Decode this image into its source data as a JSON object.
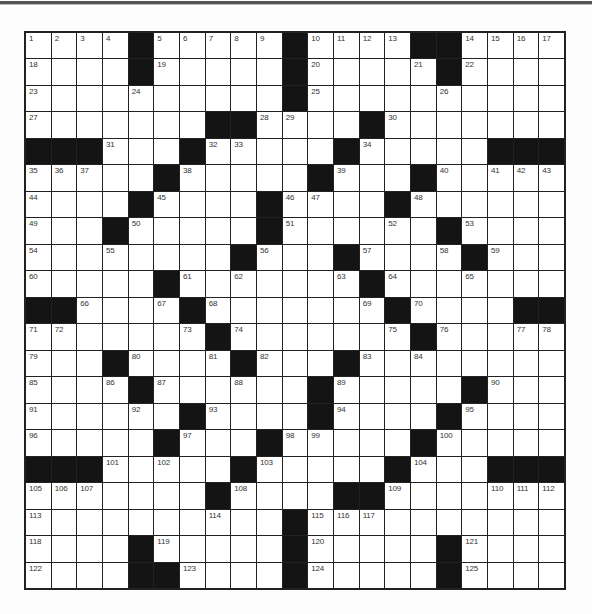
{
  "puzzle": {
    "type": "crossword",
    "rows": 21,
    "cols": 21,
    "colors": {
      "block": "#141414",
      "cell": "#ffffff",
      "gridline": "#222222",
      "number": "#333333"
    },
    "grid": [
      "....#.....#....##....",
      "....#.....#.....#....",
      "..........#..........",
      ".......##....#.......",
      "###...#.....#.....###",
      ".....#.....#...#.....",
      "....#....#....#......",
      "...#.....#......#....",
      "........#...#....#...",
      ".....#.......#.......",
      "##....#.......#....##",
      ".......#.......#.....",
      "...#....#...#........",
      "....#......#.....#...",
      "......#....#....#....",
      ".....#...#.....#.....",
      "###.....#.....#...###",
      ".......#....##.......",
      "..........#..........",
      "....#.....#.....#....",
      "....##....#.....#...."
    ],
    "numbers": [
      {
        "r": 0,
        "c": 0,
        "n": "1"
      },
      {
        "r": 0,
        "c": 1,
        "n": "2"
      },
      {
        "r": 0,
        "c": 2,
        "n": "3"
      },
      {
        "r": 0,
        "c": 3,
        "n": "4"
      },
      {
        "r": 0,
        "c": 5,
        "n": "5"
      },
      {
        "r": 0,
        "c": 6,
        "n": "6"
      },
      {
        "r": 0,
        "c": 7,
        "n": "7"
      },
      {
        "r": 0,
        "c": 8,
        "n": "8"
      },
      {
        "r": 0,
        "c": 9,
        "n": "9"
      },
      {
        "r": 0,
        "c": 11,
        "n": "10"
      },
      {
        "r": 0,
        "c": 12,
        "n": "11"
      },
      {
        "r": 0,
        "c": 13,
        "n": "12"
      },
      {
        "r": 0,
        "c": 14,
        "n": "13"
      },
      {
        "r": 0,
        "c": 17,
        "n": "14"
      },
      {
        "r": 0,
        "c": 18,
        "n": "15"
      },
      {
        "r": 0,
        "c": 19,
        "n": "16"
      },
      {
        "r": 0,
        "c": 20,
        "n": "17"
      },
      {
        "r": 1,
        "c": 0,
        "n": "18"
      },
      {
        "r": 1,
        "c": 5,
        "n": "19"
      },
      {
        "r": 1,
        "c": 11,
        "n": "20"
      },
      {
        "r": 1,
        "c": 15,
        "n": "21"
      },
      {
        "r": 1,
        "c": 17,
        "n": "22"
      },
      {
        "r": 2,
        "c": 0,
        "n": "23"
      },
      {
        "r": 2,
        "c": 4,
        "n": "24"
      },
      {
        "r": 2,
        "c": 11,
        "n": "25"
      },
      {
        "r": 2,
        "c": 16,
        "n": "26"
      },
      {
        "r": 3,
        "c": 0,
        "n": "27"
      },
      {
        "r": 3,
        "c": 9,
        "n": "28"
      },
      {
        "r": 3,
        "c": 10,
        "n": "29"
      },
      {
        "r": 3,
        "c": 14,
        "n": "30"
      },
      {
        "r": 4,
        "c": 3,
        "n": "31"
      },
      {
        "r": 4,
        "c": 7,
        "n": "32"
      },
      {
        "r": 4,
        "c": 8,
        "n": "33"
      },
      {
        "r": 4,
        "c": 13,
        "n": "34"
      },
      {
        "r": 5,
        "c": 0,
        "n": "35"
      },
      {
        "r": 5,
        "c": 1,
        "n": "36"
      },
      {
        "r": 5,
        "c": 2,
        "n": "37"
      },
      {
        "r": 5,
        "c": 6,
        "n": "38"
      },
      {
        "r": 5,
        "c": 12,
        "n": "39"
      },
      {
        "r": 5,
        "c": 16,
        "n": "40"
      },
      {
        "r": 5,
        "c": 18,
        "n": "41"
      },
      {
        "r": 5,
        "c": 19,
        "n": "42"
      },
      {
        "r": 5,
        "c": 20,
        "n": "43"
      },
      {
        "r": 6,
        "c": 0,
        "n": "44"
      },
      {
        "r": 6,
        "c": 5,
        "n": "45"
      },
      {
        "r": 6,
        "c": 10,
        "n": "46"
      },
      {
        "r": 6,
        "c": 11,
        "n": "47"
      },
      {
        "r": 6,
        "c": 15,
        "n": "48"
      },
      {
        "r": 7,
        "c": 0,
        "n": "49"
      },
      {
        "r": 7,
        "c": 4,
        "n": "50"
      },
      {
        "r": 7,
        "c": 10,
        "n": "51"
      },
      {
        "r": 7,
        "c": 14,
        "n": "52"
      },
      {
        "r": 7,
        "c": 17,
        "n": "53"
      },
      {
        "r": 8,
        "c": 0,
        "n": "54"
      },
      {
        "r": 8,
        "c": 3,
        "n": "55"
      },
      {
        "r": 8,
        "c": 9,
        "n": "56"
      },
      {
        "r": 8,
        "c": 13,
        "n": "57"
      },
      {
        "r": 8,
        "c": 16,
        "n": "58"
      },
      {
        "r": 8,
        "c": 18,
        "n": "59"
      },
      {
        "r": 9,
        "c": 0,
        "n": "60"
      },
      {
        "r": 9,
        "c": 6,
        "n": "61"
      },
      {
        "r": 9,
        "c": 8,
        "n": "62"
      },
      {
        "r": 9,
        "c": 12,
        "n": "63"
      },
      {
        "r": 9,
        "c": 14,
        "n": "64"
      },
      {
        "r": 9,
        "c": 17,
        "n": "65"
      },
      {
        "r": 10,
        "c": 2,
        "n": "66"
      },
      {
        "r": 10,
        "c": 5,
        "n": "67"
      },
      {
        "r": 10,
        "c": 7,
        "n": "68"
      },
      {
        "r": 10,
        "c": 13,
        "n": "69"
      },
      {
        "r": 10,
        "c": 15,
        "n": "70"
      },
      {
        "r": 11,
        "c": 0,
        "n": "71"
      },
      {
        "r": 11,
        "c": 1,
        "n": "72"
      },
      {
        "r": 11,
        "c": 6,
        "n": "73"
      },
      {
        "r": 11,
        "c": 8,
        "n": "74"
      },
      {
        "r": 11,
        "c": 14,
        "n": "75"
      },
      {
        "r": 11,
        "c": 16,
        "n": "76"
      },
      {
        "r": 11,
        "c": 19,
        "n": "77"
      },
      {
        "r": 11,
        "c": 20,
        "n": "78"
      },
      {
        "r": 12,
        "c": 0,
        "n": "79"
      },
      {
        "r": 12,
        "c": 4,
        "n": "80"
      },
      {
        "r": 12,
        "c": 7,
        "n": "81"
      },
      {
        "r": 12,
        "c": 9,
        "n": "82"
      },
      {
        "r": 12,
        "c": 13,
        "n": "83"
      },
      {
        "r": 12,
        "c": 15,
        "n": "84"
      },
      {
        "r": 13,
        "c": 0,
        "n": "85"
      },
      {
        "r": 13,
        "c": 3,
        "n": "86"
      },
      {
        "r": 13,
        "c": 5,
        "n": "87"
      },
      {
        "r": 13,
        "c": 8,
        "n": "88"
      },
      {
        "r": 13,
        "c": 12,
        "n": "89"
      },
      {
        "r": 13,
        "c": 18,
        "n": "90"
      },
      {
        "r": 14,
        "c": 0,
        "n": "91"
      },
      {
        "r": 14,
        "c": 4,
        "n": "92"
      },
      {
        "r": 14,
        "c": 7,
        "n": "93"
      },
      {
        "r": 14,
        "c": 12,
        "n": "94"
      },
      {
        "r": 14,
        "c": 17,
        "n": "95"
      },
      {
        "r": 15,
        "c": 0,
        "n": "96"
      },
      {
        "r": 15,
        "c": 6,
        "n": "97"
      },
      {
        "r": 15,
        "c": 10,
        "n": "98"
      },
      {
        "r": 15,
        "c": 11,
        "n": "99"
      },
      {
        "r": 15,
        "c": 16,
        "n": "100"
      },
      {
        "r": 16,
        "c": 3,
        "n": "101"
      },
      {
        "r": 16,
        "c": 5,
        "n": "102"
      },
      {
        "r": 16,
        "c": 9,
        "n": "103"
      },
      {
        "r": 16,
        "c": 15,
        "n": "104"
      },
      {
        "r": 17,
        "c": 0,
        "n": "105"
      },
      {
        "r": 17,
        "c": 1,
        "n": "106"
      },
      {
        "r": 17,
        "c": 2,
        "n": "107"
      },
      {
        "r": 17,
        "c": 8,
        "n": "108"
      },
      {
        "r": 17,
        "c": 14,
        "n": "109"
      },
      {
        "r": 17,
        "c": 18,
        "n": "110"
      },
      {
        "r": 17,
        "c": 19,
        "n": "111"
      },
      {
        "r": 17,
        "c": 20,
        "n": "112"
      },
      {
        "r": 18,
        "c": 0,
        "n": "113"
      },
      {
        "r": 18,
        "c": 7,
        "n": "114"
      },
      {
        "r": 18,
        "c": 11,
        "n": "115"
      },
      {
        "r": 18,
        "c": 12,
        "n": "116"
      },
      {
        "r": 18,
        "c": 13,
        "n": "117"
      },
      {
        "r": 19,
        "c": 0,
        "n": "118"
      },
      {
        "r": 19,
        "c": 5,
        "n": "119"
      },
      {
        "r": 19,
        "c": 11,
        "n": "120"
      },
      {
        "r": 19,
        "c": 17,
        "n": "121"
      },
      {
        "r": 20,
        "c": 0,
        "n": "122"
      },
      {
        "r": 20,
        "c": 6,
        "n": "123"
      },
      {
        "r": 20,
        "c": 11,
        "n": "124"
      },
      {
        "r": 20,
        "c": 17,
        "n": "125"
      }
    ],
    "fills": []
  }
}
